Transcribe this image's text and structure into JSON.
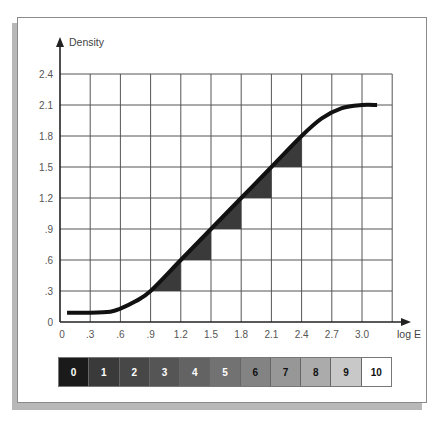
{
  "chart_data": {
    "type": "line",
    "title": "",
    "xlabel": "log E",
    "ylabel": "Density",
    "xlim": [
      0,
      3.3
    ],
    "ylim": [
      0,
      2.4
    ],
    "grid": true,
    "x_ticks": [
      "0",
      ".3",
      ".6",
      ".9",
      "1.2",
      "1.5",
      "1.8",
      "2.1",
      "2.4",
      "2.7",
      "3.0"
    ],
    "y_ticks": [
      "0",
      ".3",
      ".6",
      ".9",
      "1.2",
      "1.5",
      "1.8",
      "2.1",
      "2.4"
    ],
    "series": [
      {
        "name": "characteristic curve",
        "x": [
          0.07,
          0.3,
          0.5,
          0.6,
          0.75,
          0.9,
          1.2,
          1.5,
          1.8,
          2.1,
          2.4,
          2.6,
          2.8,
          3.0,
          3.15
        ],
        "y": [
          0.09,
          0.09,
          0.1,
          0.13,
          0.2,
          0.3,
          0.6,
          0.9,
          1.2,
          1.5,
          1.8,
          1.97,
          2.07,
          2.1,
          2.1
        ]
      }
    ],
    "annotations": {
      "shaded_triangles": [
        {
          "from": [
            0.9,
            0.3
          ],
          "to": [
            1.2,
            0.6
          ]
        },
        {
          "from": [
            1.2,
            0.6
          ],
          "to": [
            1.5,
            0.9
          ]
        },
        {
          "from": [
            1.5,
            0.9
          ],
          "to": [
            1.8,
            1.2
          ]
        },
        {
          "from": [
            1.8,
            1.2
          ],
          "to": [
            2.1,
            1.5
          ]
        },
        {
          "from": [
            2.1,
            1.5
          ],
          "to": [
            2.4,
            1.8
          ]
        }
      ]
    },
    "gray_scale": {
      "labels": [
        "0",
        "1",
        "2",
        "3",
        "4",
        "5",
        "6",
        "7",
        "8",
        "9",
        "10"
      ],
      "colors": [
        "#1a1a1a",
        "#3a3a3a",
        "#474747",
        "#555555",
        "#636363",
        "#727272",
        "#838383",
        "#979797",
        "#ababab",
        "#c8c8c8",
        "#ffffff"
      ],
      "text_colors": [
        "#ffffff",
        "#ffffff",
        "#ffffff",
        "#ffffff",
        "#ffffff",
        "#ffffff",
        "#111111",
        "#111111",
        "#111111",
        "#111111",
        "#111111"
      ]
    }
  }
}
